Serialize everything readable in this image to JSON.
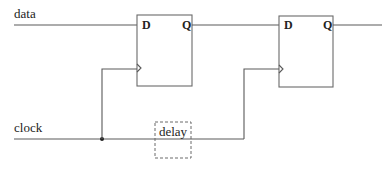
{
  "diagram": {
    "type": "circuit-schematic",
    "signals": {
      "data": "data",
      "clock": "clock"
    },
    "components": [
      {
        "id": "ff1",
        "kind": "D flip-flop",
        "input_pin": "D",
        "output_pin": "Q",
        "clock_pin": ">"
      },
      {
        "id": "ff2",
        "kind": "D flip-flop",
        "input_pin": "D",
        "output_pin": "Q",
        "clock_pin": ">"
      },
      {
        "id": "delay",
        "kind": "delay element (dashed)",
        "label": "delay"
      }
    ],
    "connections": [
      "data -> ff1.D",
      "ff1.Q -> ff2.D",
      "ff2.Q -> output",
      "clock -> junction -> ff1.clk",
      "clock -> delay -> ff2.clk"
    ],
    "colors": {
      "line": "#5a5a5a",
      "text": "#222222",
      "background": "#ffffff"
    }
  }
}
